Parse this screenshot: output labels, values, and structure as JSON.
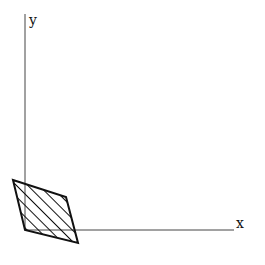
{
  "diagram": {
    "type": "coordinate-plane-with-shaded-parallelogram",
    "axes": {
      "x_label": "x",
      "y_label": "y",
      "color": "#444444"
    },
    "shape": {
      "kind": "parallelogram",
      "fill": "diagonal-hatch",
      "stroke_color": "#111111",
      "vertices_px": [
        [
          13,
          180
        ],
        [
          66,
          197
        ],
        [
          78,
          243
        ],
        [
          25,
          230
        ]
      ]
    }
  }
}
